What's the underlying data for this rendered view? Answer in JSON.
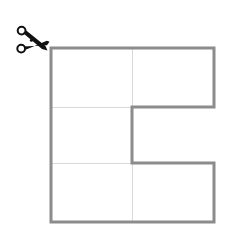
{
  "figure": {
    "background_color": "#ffffff",
    "canvas": {
      "width": 234,
      "height": 237
    }
  },
  "scissors": {
    "icon_name": "scissors-icon",
    "label": "scissors",
    "color": "#111111",
    "position": {
      "x": 14,
      "y": 26,
      "width": 36,
      "height": 32
    },
    "orientation": "blades-pointing-down-right"
  },
  "shape": {
    "name": "c-shape-polygon",
    "description": "Large square with a rectangular notch removed from the middle-right, forming a C / E outline",
    "outline_color": "#8c8c8c",
    "outline_width": 3,
    "fill_color": "#ffffff",
    "grid_line_color": "#d9d9d9",
    "grid_line_width": 1,
    "bounds": {
      "left": 51,
      "top": 48,
      "right": 214,
      "bottom": 222
    },
    "notch": {
      "left": 132,
      "top": 107,
      "right": 214,
      "bottom": 163
    },
    "vertices": [
      {
        "x": 51,
        "y": 48
      },
      {
        "x": 214,
        "y": 48
      },
      {
        "x": 214,
        "y": 107
      },
      {
        "x": 132,
        "y": 107
      },
      {
        "x": 132,
        "y": 163
      },
      {
        "x": 214,
        "y": 163
      },
      {
        "x": 214,
        "y": 222
      },
      {
        "x": 51,
        "y": 222
      }
    ],
    "grid_lines": [
      {
        "name": "horizontal-upper",
        "x1": 51,
        "y1": 107,
        "x2": 132,
        "y2": 107
      },
      {
        "name": "horizontal-lower",
        "x1": 51,
        "y1": 163,
        "x2": 132,
        "y2": 163
      },
      {
        "name": "vertical-top-cell",
        "x1": 132,
        "y1": 48,
        "x2": 132,
        "y2": 107
      },
      {
        "name": "vertical-bottom-cell",
        "x1": 132,
        "y1": 163,
        "x2": 132,
        "y2": 222
      }
    ],
    "cells": [
      {
        "name": "cell-top-left",
        "x": 51,
        "y": 48,
        "w": 81,
        "h": 59
      },
      {
        "name": "cell-top-right",
        "x": 132,
        "y": 48,
        "w": 82,
        "h": 59
      },
      {
        "name": "cell-middle-left",
        "x": 51,
        "y": 107,
        "w": 81,
        "h": 56
      },
      {
        "name": "cell-bottom-left",
        "x": 51,
        "y": 163,
        "w": 81,
        "h": 59
      },
      {
        "name": "cell-bottom-right",
        "x": 132,
        "y": 163,
        "w": 82,
        "h": 59
      }
    ]
  }
}
